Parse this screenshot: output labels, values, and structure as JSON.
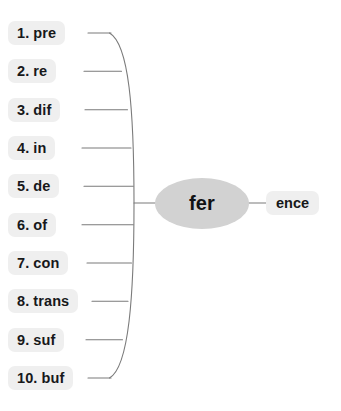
{
  "diagram": {
    "type": "word-building-web",
    "root": {
      "label": "fer",
      "shape": "ellipse",
      "fill": "#d2d2d2"
    },
    "suffix": {
      "label": "ence",
      "fill": "#efefef"
    },
    "brace": {
      "color": "#7b7b7b",
      "orientation": "right-bulging"
    },
    "prefixes": [
      {
        "index": "1.",
        "label": "pre"
      },
      {
        "index": "2.",
        "label": "re"
      },
      {
        "index": "3.",
        "label": "dif"
      },
      {
        "index": "4.",
        "label": "in"
      },
      {
        "index": "5.",
        "label": "de"
      },
      {
        "index": "6.",
        "label": "of"
      },
      {
        "index": "7.",
        "label": "con"
      },
      {
        "index": "8.",
        "label": "trans"
      },
      {
        "index": "9.",
        "label": "suf"
      },
      {
        "index": "10.",
        "label": "buf"
      }
    ]
  }
}
